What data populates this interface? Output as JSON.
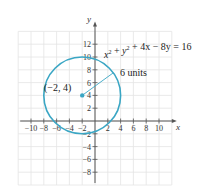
{
  "chart_data": {
    "type": "line",
    "title": "",
    "xlabel": "x",
    "ylabel": "y",
    "xlim": [
      -12,
      12
    ],
    "ylim": [
      -10,
      14
    ],
    "grid": true,
    "x_ticks": [
      -10,
      -8,
      -6,
      -4,
      -2,
      2,
      4,
      6,
      8,
      10
    ],
    "x_tick_labels": [
      "−10",
      "−8",
      "−6",
      "−4",
      "−2",
      "2",
      "4",
      "6",
      "8",
      "10"
    ],
    "y_ticks": [
      12,
      10,
      8,
      6,
      4,
      2,
      -2,
      -4,
      -6,
      -8
    ],
    "y_tick_labels": [
      "12",
      "10",
      "8",
      "6",
      "4",
      "2",
      "−2",
      "−4",
      "−6",
      "−8"
    ],
    "series": [
      {
        "name": "circle",
        "equation": "x² + y² + 4x − 8y = 16",
        "center": [
          -2,
          4
        ],
        "radius": 6,
        "color": "#3aa6c4"
      }
    ],
    "annotations": [
      {
        "text": "(−2, 4)",
        "point": [
          -2,
          4
        ],
        "type": "center-point"
      },
      {
        "text": "6 units",
        "type": "radius-label"
      },
      {
        "text": "x² + y² + 4x − 8y = 16",
        "type": "equation-label"
      }
    ]
  },
  "labels": {
    "x_axis": "x",
    "y_axis": "y",
    "center": "(−2, 4)",
    "radius": "6 units",
    "equation_x": "x",
    "equation_sup1": "2",
    "equation_plus1": " + ",
    "equation_y": "y",
    "equation_sup2": "2",
    "equation_rest": " + 4x − 8y = 16"
  },
  "colors": {
    "circle": "#3aa6c4",
    "grid": "#e4e4e4",
    "axis": "#555555"
  }
}
